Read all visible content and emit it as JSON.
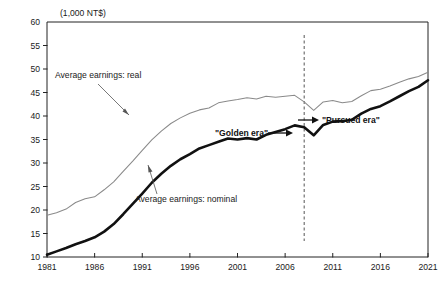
{
  "chart_data": {
    "type": "line",
    "title": "",
    "subtitle": "",
    "xlabel": "",
    "ylabel": "",
    "unit_label": "(1,000 NT$)",
    "xlim": [
      1981,
      2021
    ],
    "ylim": [
      10,
      60
    ],
    "y_ticks": [
      10,
      15,
      20,
      25,
      30,
      35,
      40,
      45,
      50,
      55,
      60
    ],
    "x_ticks": [
      1981,
      1986,
      1991,
      1996,
      2001,
      2006,
      2011,
      2016,
      2021
    ],
    "grid": false,
    "legend_position": "inline-annotations",
    "x": [
      1981,
      1982,
      1983,
      1984,
      1985,
      1986,
      1987,
      1988,
      1989,
      1990,
      1991,
      1992,
      1993,
      1994,
      1995,
      1996,
      1997,
      1998,
      1999,
      2000,
      2001,
      2002,
      2003,
      2004,
      2005,
      2006,
      2007,
      2008,
      2009,
      2010,
      2011,
      2012,
      2013,
      2014,
      2015,
      2016,
      2017,
      2018,
      2019,
      2020,
      2021
    ],
    "series": [
      {
        "name": "Average earnings: real",
        "style": "thin-gray",
        "color": "#8a8a8a",
        "values": [
          18.9,
          19.4,
          20.2,
          21.6,
          22.4,
          22.8,
          24.3,
          26.0,
          28.2,
          30.4,
          32.7,
          34.9,
          36.8,
          38.4,
          39.6,
          40.6,
          41.3,
          41.7,
          42.8,
          43.2,
          43.5,
          43.9,
          43.6,
          44.2,
          44.0,
          44.2,
          44.4,
          43.0,
          41.2,
          43.0,
          43.3,
          42.8,
          43.1,
          44.3,
          45.4,
          45.7,
          46.4,
          47.2,
          47.9,
          48.4,
          49.3
        ]
      },
      {
        "name": "Average earnings: nominal",
        "style": "thick-black",
        "color": "#111111",
        "values": [
          10.5,
          11.2,
          11.9,
          12.7,
          13.4,
          14.2,
          15.4,
          17.0,
          19.1,
          21.3,
          23.5,
          25.8,
          27.7,
          29.4,
          30.8,
          31.9,
          33.1,
          33.8,
          34.5,
          35.2,
          35.0,
          35.3,
          35.0,
          36.0,
          36.6,
          37.2,
          38.0,
          37.6,
          35.9,
          38.1,
          38.8,
          38.9,
          39.2,
          40.5,
          41.5,
          42.1,
          43.1,
          44.2,
          45.3,
          46.2,
          47.6
        ]
      }
    ],
    "annotations": [
      {
        "name": "real-series-label",
        "text": "Average earnings: real",
        "x": 1984,
        "y": 50.5
      },
      {
        "name": "nominal-series-label",
        "text": "Average earnings: nominal",
        "x": 1991,
        "y": 22.0
      },
      {
        "name": "golden-era-label",
        "text": "\"Golden era\"",
        "x": 2002,
        "y": 33.5
      },
      {
        "name": "pursued-era-label",
        "text": "\"Pursued era\"",
        "x": 2011,
        "y": 36.5
      }
    ],
    "vertical_divider": {
      "name": "era-divider",
      "x": 2008,
      "style": "dashed"
    }
  },
  "axes": {
    "y_tick_labels": [
      "60",
      "55",
      "50",
      "45",
      "40",
      "35",
      "30",
      "25",
      "20",
      "15",
      "10"
    ],
    "x_tick_labels": [
      "1981",
      "1986",
      "1991",
      "1996",
      "2001",
      "2006",
      "2011",
      "2016",
      "2021"
    ],
    "unit_label": "(1,000 NT$)"
  },
  "annotations_text": {
    "real_label": "Average earnings: real",
    "nominal_label": "Average earnings: nominal",
    "golden_era": "\"Golden era\"",
    "pursued_era": "\"Pursued era\""
  }
}
